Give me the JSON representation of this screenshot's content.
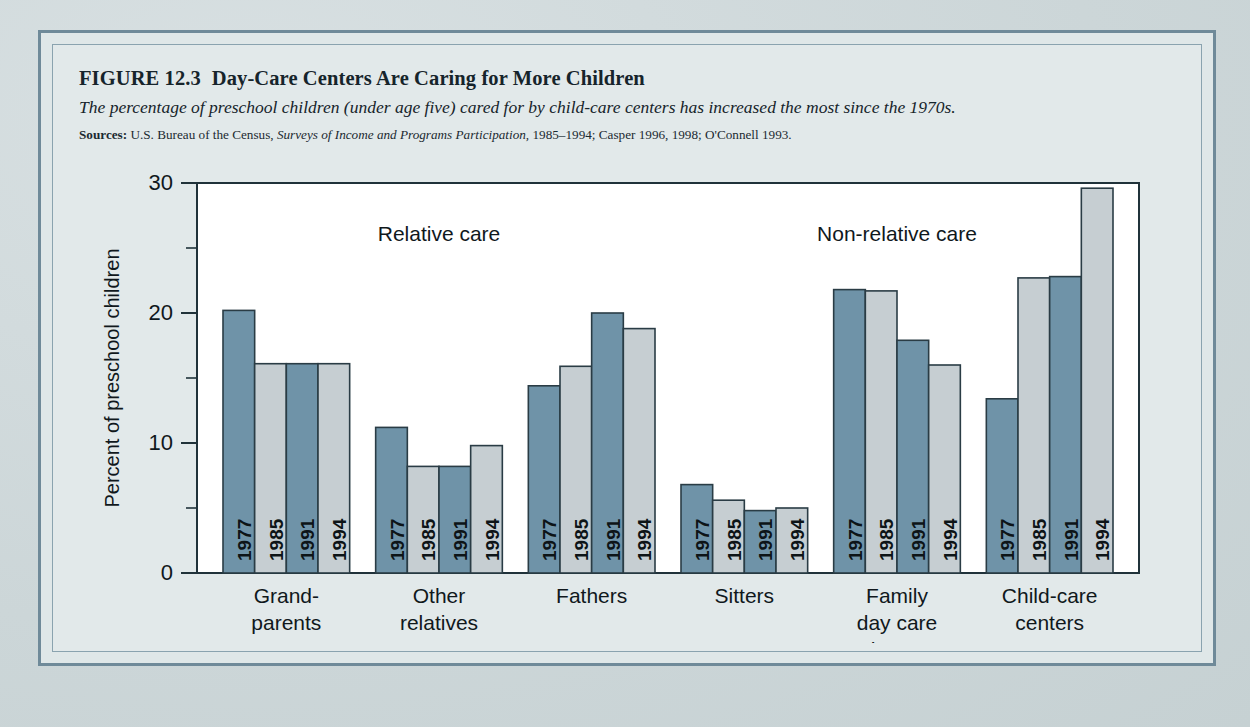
{
  "figure": {
    "number": "FIGURE 12.3",
    "title": "Day-Care Centers Are Caring for More Children",
    "subtitle": "The percentage of preschool children (under age five) cared for by child-care centers has increased the most since the 1970s.",
    "sources_label": "Sources:",
    "sources_part1": "U.S. Bureau of the Census,",
    "sources_italic": "Surveys of Income and Programs Participation,",
    "sources_part2": "1985–1994; Casper 1996, 1998; O'Connell 1993."
  },
  "colors": {
    "bar_dark": "#6f93a8",
    "bar_light": "#c6ced2",
    "bar_outline": "#2a3c45",
    "frame": "#6f8a99",
    "page_bg": "#ccd6d8",
    "panel_bg": "#e2e9ea",
    "plot_bg": "#ffffff",
    "ink": "#10181c"
  },
  "chart_data": {
    "type": "bar",
    "title": "Day-Care Centers Are Caring for More Children",
    "subtitle": "The percentage of preschool children (under age five) cared for by child-care centers has increased the most since the 1970s.",
    "xlabel": "",
    "ylabel": "Percent of preschool children",
    "ylim": [
      0,
      30
    ],
    "yticks": [
      0,
      5,
      10,
      15,
      20,
      25,
      30
    ],
    "ytick_labels": [
      "0",
      "",
      "10",
      "",
      "20",
      "",
      "30"
    ],
    "major_ticks": [
      0,
      10,
      20,
      30
    ],
    "minor_ticks": [
      5,
      15,
      25
    ],
    "grid": false,
    "legend_position": "none",
    "categories": [
      "Grand-\nparents",
      "Other\nrelatives",
      "Fathers",
      "Sitters",
      "Family\nday care\nhome",
      "Child-care\ncenters"
    ],
    "category_lines": [
      [
        "Grand-",
        "parents"
      ],
      [
        "Other",
        "relatives"
      ],
      [
        "Fathers"
      ],
      [
        "Sitters"
      ],
      [
        "Family",
        "day care",
        "home"
      ],
      [
        "Child-care",
        "centers"
      ]
    ],
    "series": [
      {
        "name": "1977",
        "values": [
          20.2,
          11.2,
          14.4,
          6.8,
          21.8,
          13.4
        ],
        "color": "#6f93a8"
      },
      {
        "name": "1985",
        "values": [
          16.1,
          8.2,
          15.9,
          5.6,
          21.7,
          22.7
        ],
        "color": "#c6ced2"
      },
      {
        "name": "1991",
        "values": [
          16.1,
          8.2,
          20.0,
          4.8,
          17.9,
          22.8
        ],
        "color": "#6f93a8"
      },
      {
        "name": "1994",
        "values": [
          16.1,
          9.8,
          18.8,
          5.0,
          16.0,
          29.6
        ],
        "color": "#c6ced2"
      }
    ],
    "annotations": [
      {
        "text": "Relative care",
        "group_span": [
          0,
          2
        ]
      },
      {
        "text": "Non-relative care",
        "group_span": [
          3,
          5
        ]
      }
    ]
  }
}
